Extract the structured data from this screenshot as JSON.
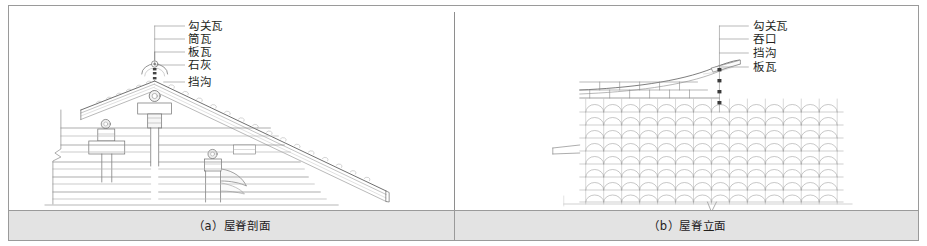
{
  "figure": {
    "panels": [
      {
        "id": "panel-a",
        "caption": "（a）屋脊剖面",
        "view_type": "section",
        "callouts": [
          {
            "label": "勾关瓦",
            "index": 1
          },
          {
            "label": "筒瓦",
            "index": 2
          },
          {
            "label": "板瓦",
            "index": 3
          },
          {
            "label": "石灰",
            "index": 4
          },
          {
            "label": "挡沟",
            "index": 5
          }
        ]
      },
      {
        "id": "panel-b",
        "caption": "（b）屋脊立面",
        "view_type": "elevation",
        "callouts": [
          {
            "label": "勾关瓦",
            "index": 1
          },
          {
            "label": "吞口",
            "index": 2
          },
          {
            "label": "挡沟",
            "index": 3
          },
          {
            "label": "板瓦",
            "index": 4
          }
        ]
      }
    ],
    "colors": {
      "frame": "#9a9a9a",
      "caption_band": "#e3e3e3",
      "line": "#6f6f6f",
      "line_light": "#b4b4b4",
      "text": "#231f1c",
      "background": "#ffffff"
    }
  }
}
